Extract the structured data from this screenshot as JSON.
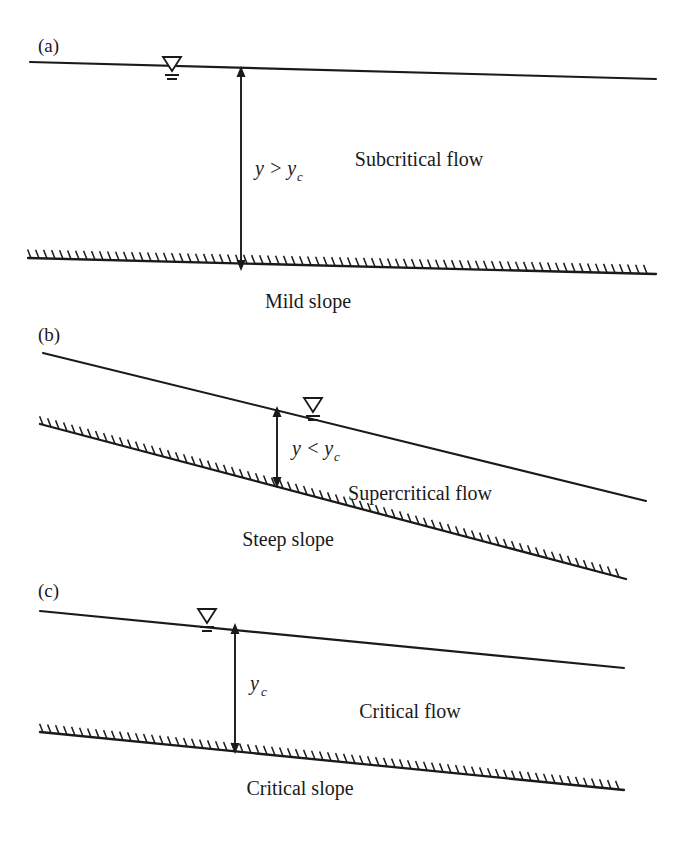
{
  "figure": {
    "background_color": "#ffffff",
    "ink_color": "#1a1a1a",
    "width": 681,
    "height": 851
  },
  "panels": [
    {
      "id": "a",
      "label": "(a)",
      "flow_label": "Subcritical flow",
      "slope_label": "Mild slope",
      "depth_label": "y > y",
      "depth_subscript": "c",
      "water_symbol": "water-surface-triangle",
      "surface_line": {
        "x1": 30,
        "y1": 62,
        "x2": 656,
        "y2": 79
      },
      "bed_line": {
        "x1": 28,
        "y1": 258,
        "x2": 656,
        "y2": 274
      },
      "dimension_arrow": {
        "x": 241,
        "y_top": 71,
        "y_bottom": 266
      },
      "symbol_pos": {
        "x": 172,
        "y": 67
      },
      "flow_label_pos": {
        "x": 419,
        "y": 166
      },
      "slope_label_pos": {
        "x": 308,
        "y": 308
      },
      "depth_label_pos": {
        "x": 255,
        "y": 175
      }
    },
    {
      "id": "b",
      "label": "(b)",
      "flow_label": "Supercritical flow",
      "slope_label": "Steep slope",
      "depth_label": "y < y",
      "depth_subscript": "c",
      "water_symbol": "water-surface-triangle",
      "surface_line": {
        "x1": 43,
        "y1": 353,
        "x2": 646,
        "y2": 501
      },
      "bed_line": {
        "x1": 40,
        "y1": 424,
        "x2": 626,
        "y2": 579
      },
      "dimension_arrow": {
        "x": 277,
        "y_top": 411,
        "y_bottom": 483
      },
      "symbol_pos": {
        "x": 313,
        "y": 411
      },
      "flow_label_pos": {
        "x": 420,
        "y": 500
      },
      "slope_label_pos": {
        "x": 288,
        "y": 546
      },
      "depth_label_pos": {
        "x": 292,
        "y": 455
      }
    },
    {
      "id": "c",
      "label": "(c)",
      "flow_label": "Critical flow",
      "slope_label": "Critical slope",
      "depth_label": "y",
      "depth_subscript": "c",
      "water_symbol": "water-surface-triangle",
      "surface_line": {
        "x1": 40,
        "y1": 611,
        "x2": 624,
        "y2": 668
      },
      "bed_line": {
        "x1": 40,
        "y1": 732,
        "x2": 624,
        "y2": 790
      },
      "dimension_arrow": {
        "x": 235,
        "y_top": 628,
        "y_bottom": 749
      },
      "symbol_pos": {
        "x": 207,
        "y": 622
      },
      "flow_label_pos": {
        "x": 410,
        "y": 718
      },
      "slope_label_pos": {
        "x": 300,
        "y": 795
      },
      "depth_label_pos": {
        "x": 250,
        "y": 690
      }
    }
  ],
  "legend_symbols": {
    "water_surface": "inverted-triangle-with-two-bars",
    "channel_bed": "hatched-line"
  }
}
